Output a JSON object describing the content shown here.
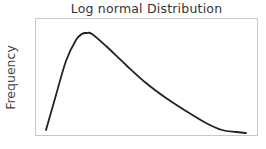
{
  "chart_data": {
    "type": "line",
    "title": "Log normal Distribution",
    "xlabel": "",
    "ylabel": "Frequency",
    "grid": false,
    "legend": null,
    "x_ticks": [],
    "y_ticks": [],
    "x": [
      0.0,
      0.05,
      0.1,
      0.15,
      0.18,
      0.2,
      0.23,
      0.3,
      0.4,
      0.5,
      0.6,
      0.7,
      0.8,
      0.88,
      0.95,
      1.0
    ],
    "values": [
      0.03,
      0.38,
      0.72,
      0.93,
      0.99,
      1.0,
      0.99,
      0.87,
      0.68,
      0.5,
      0.35,
      0.22,
      0.1,
      0.03,
      0.01,
      0.0
    ],
    "series": [
      {
        "name": "Log normal density",
        "color": "#222222"
      }
    ]
  },
  "colors": {
    "line": "#222222",
    "frame": "#c8c8c8",
    "text": "#333333"
  }
}
